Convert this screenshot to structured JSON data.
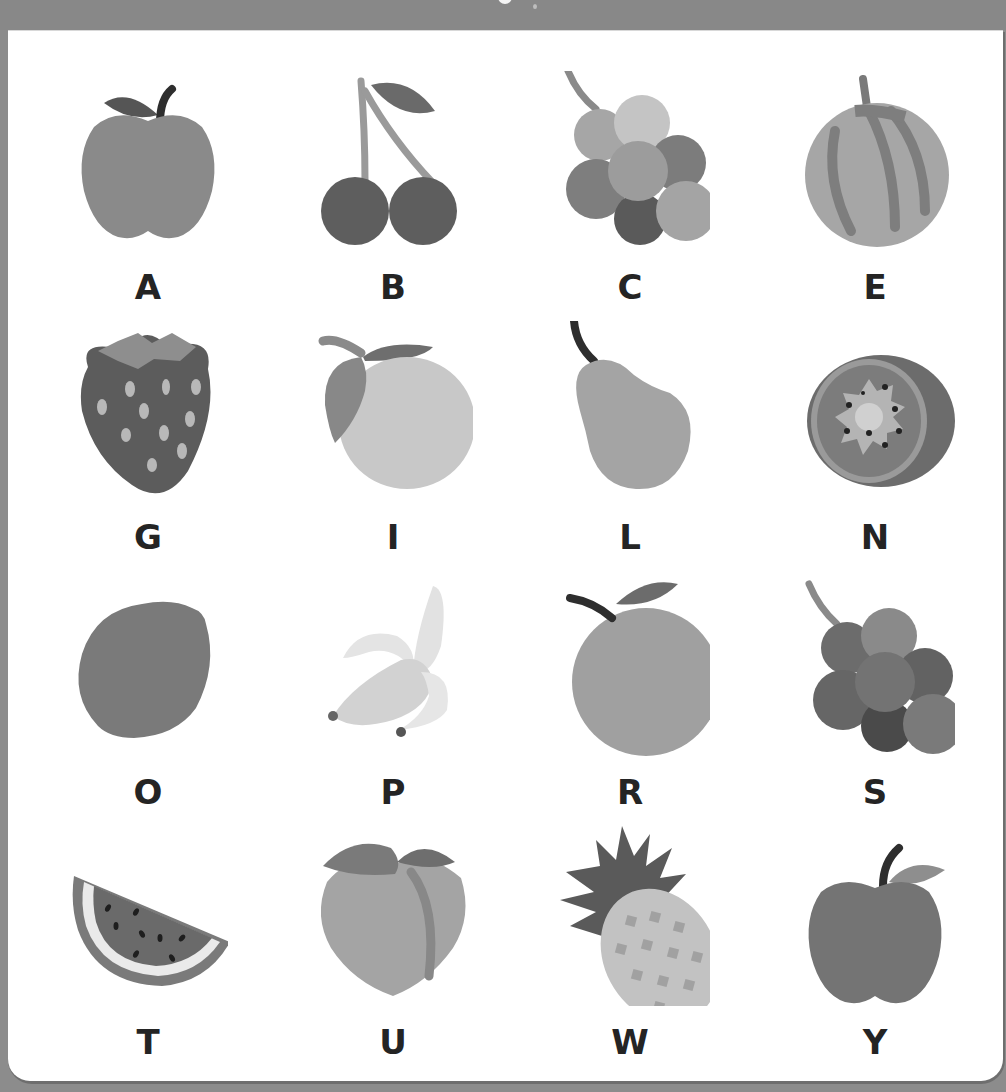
{
  "worksheet": {
    "title_partial": "",
    "colors": {
      "frame": "#8c8c8c",
      "card": "#ffffff",
      "letter": "#242424"
    },
    "items": [
      {
        "letter": "A",
        "fruit": "apple-icon"
      },
      {
        "letter": "B",
        "fruit": "cherry-icon"
      },
      {
        "letter": "C",
        "fruit": "grapes-icon"
      },
      {
        "letter": "E",
        "fruit": "melon-icon"
      },
      {
        "letter": "G",
        "fruit": "strawberry-icon"
      },
      {
        "letter": "I",
        "fruit": "lemon-icon"
      },
      {
        "letter": "L",
        "fruit": "pear-icon"
      },
      {
        "letter": "N",
        "fruit": "kiwi-icon"
      },
      {
        "letter": "O",
        "fruit": "lime-icon"
      },
      {
        "letter": "P",
        "fruit": "banana-icon"
      },
      {
        "letter": "R",
        "fruit": "orange-icon"
      },
      {
        "letter": "S",
        "fruit": "grapes-dark-icon"
      },
      {
        "letter": "T",
        "fruit": "watermelon-icon"
      },
      {
        "letter": "U",
        "fruit": "peach-icon"
      },
      {
        "letter": "W",
        "fruit": "pineapple-icon"
      },
      {
        "letter": "Y",
        "fruit": "apple-red-icon"
      }
    ]
  }
}
